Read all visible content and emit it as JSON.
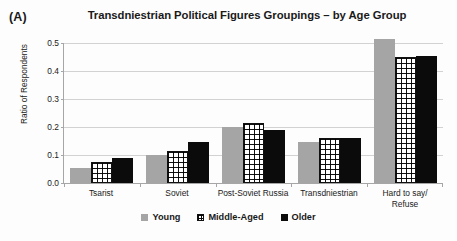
{
  "panel": {
    "label": "(A)"
  },
  "chart_data": {
    "type": "bar",
    "title": "Transdniestrian Political Figures Groupings – by Age Group",
    "xlabel": "",
    "ylabel": "Ratio of Respondents",
    "ylim": [
      0.0,
      0.5
    ],
    "ytick_labels": [
      "0.5",
      "0.4",
      "0.3",
      "0.2",
      "0.1",
      "0.0"
    ],
    "ytick_values": [
      0.5,
      0.4,
      0.3,
      0.2,
      0.1,
      0.0
    ],
    "grid": true,
    "legend_position": "bottom",
    "categories": [
      "Tsarist",
      "Soviet",
      "Post-Soviet Russia",
      "Transdniestrian",
      "Hard to say/\nRefuse"
    ],
    "series": [
      {
        "name": "Young",
        "color": "#a5a5a5",
        "pattern": "solid-gray",
        "values": [
          0.055,
          0.1,
          0.2,
          0.145,
          0.515
        ]
      },
      {
        "name": "Middle-Aged",
        "color": "#111111",
        "pattern": "crosshatch",
        "values": [
          0.075,
          0.115,
          0.215,
          0.16,
          0.45
        ]
      },
      {
        "name": "Older",
        "color": "#0b0b0b",
        "pattern": "solid-black",
        "values": [
          0.09,
          0.145,
          0.19,
          0.16,
          0.455
        ]
      }
    ]
  }
}
